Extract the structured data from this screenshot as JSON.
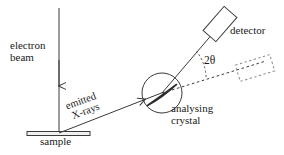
{
  "figure": {
    "background_color": "#ffffff",
    "stroke_color": "#3a3a3a",
    "text_color": "#1a1a1a"
  },
  "labels": {
    "electron_beam": "electron\nbeam",
    "emitted_xrays": "emitted\n X-rays",
    "sample": "sample",
    "analysing_crystal": "analysing\ncrystal",
    "detector": "detector",
    "two_theta": "2θ"
  },
  "diagram_data": {
    "type": "schematic",
    "components": [
      {
        "name": "electron-beam",
        "kind": "arrow",
        "label": "electron beam",
        "from": [
          59,
          8
        ],
        "to": [
          59,
          133
        ],
        "direction": "downward",
        "arrowhead_at": [
          59,
          90
        ]
      },
      {
        "name": "sample",
        "kind": "horizontal-bar",
        "label": "sample",
        "x1": 27,
        "x2": 90,
        "y": 133,
        "thickness": 4
      },
      {
        "name": "emitted-xrays",
        "kind": "arrow",
        "label": "emitted X-rays",
        "from": [
          59,
          133
        ],
        "to": [
          162,
          93
        ],
        "direction": "up-right",
        "arrowhead_at": [
          143,
          96
        ],
        "angle_deg": -20
      },
      {
        "name": "analysing-crystal",
        "kind": "circle-with-crystal",
        "label": "analysing crystal",
        "center": [
          162,
          93
        ],
        "radius": 20,
        "crystal_line_from": [
          148,
          105
        ],
        "crystal_line_to": [
          176,
          84
        ]
      },
      {
        "name": "diffracted-beam",
        "kind": "line",
        "from": [
          162,
          93
        ],
        "to": [
          216,
          30
        ],
        "style": "solid"
      },
      {
        "name": "undeviated-beam",
        "kind": "line",
        "from": [
          162,
          93
        ],
        "to": [
          262,
          62
        ],
        "style": "dashed"
      },
      {
        "name": "detector",
        "kind": "rotated-rectangle",
        "label": "detector",
        "center": [
          220,
          24
        ],
        "width": 32,
        "height": 17,
        "rotation_deg": -49,
        "style": "solid"
      },
      {
        "name": "detector-ghost",
        "kind": "rotated-rectangle",
        "center": [
          255,
          68
        ],
        "width": 36,
        "height": 17,
        "rotation_deg": -17,
        "style": "dashed"
      },
      {
        "name": "two-theta-angle",
        "kind": "angle-arc",
        "label": "2θ",
        "vertex": [
          162,
          93
        ],
        "between": [
          "diffracted-beam",
          "undeviated-beam"
        ],
        "arc_radius": 46
      }
    ]
  }
}
